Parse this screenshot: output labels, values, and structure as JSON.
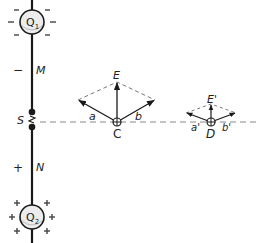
{
  "diagram": {
    "charges": {
      "top": {
        "label": "Q",
        "subscript": "1",
        "sign_symbol": "−"
      },
      "bottom": {
        "label": "Q",
        "subscript": "2",
        "sign_symbol": "+"
      }
    },
    "wire_labels": {
      "upper_segment": "M",
      "lower_segment": "N",
      "upper_sign": "−",
      "lower_sign": "+",
      "switch": "S"
    },
    "point_c": {
      "label": "C",
      "field_resultant": "E",
      "component_a": "a",
      "component_b": "b"
    },
    "point_d": {
      "label": "D",
      "field_resultant": "E'",
      "component_a": "a'",
      "component_b": "b'"
    },
    "colors": {
      "line": "#1a1a1a",
      "dashed": "#777777",
      "charge_fill": "#e6e6e6"
    }
  }
}
